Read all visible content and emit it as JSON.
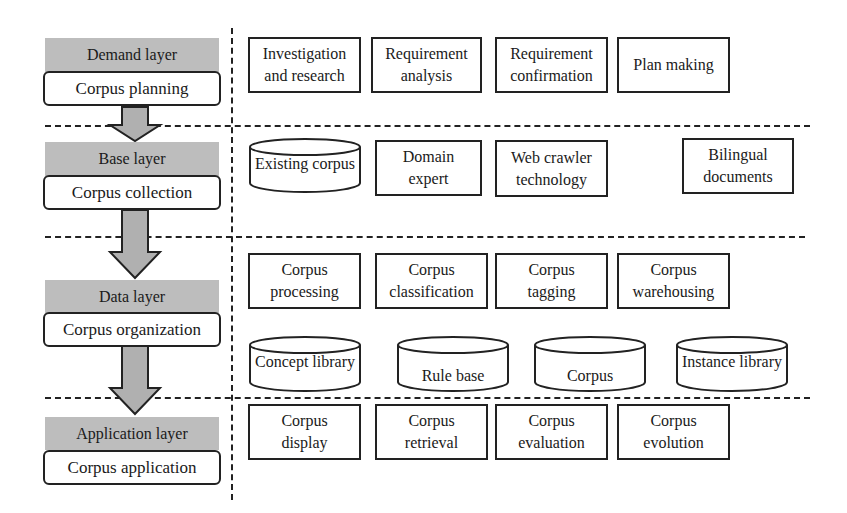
{
  "layers": [
    {
      "name": "Demand layer",
      "stage": "Corpus planning"
    },
    {
      "name": "Base layer",
      "stage": "Corpus collection"
    },
    {
      "name": "Data layer",
      "stage": "Corpus organization"
    },
    {
      "name": "Application layer",
      "stage": "Corpus application"
    }
  ],
  "demand": {
    "items": [
      "Investigation\nand research",
      "Requirement\nanalysis",
      "Requirement\nconfirmation",
      "Plan making"
    ]
  },
  "base": {
    "items": [
      {
        "label": "Existing corpus",
        "shape": "database"
      },
      {
        "label": "Domain\nexpert",
        "shape": "box"
      },
      {
        "label": "Web crawler\ntechnology",
        "shape": "box"
      },
      {
        "label": "Bilingual\ndocuments",
        "shape": "box"
      }
    ]
  },
  "data": {
    "processes": [
      "Corpus\nprocessing",
      "Corpus\nclassification",
      "Corpus\ntagging",
      "Corpus\nwarehousing"
    ],
    "stores": [
      "Concept library",
      "Rule base",
      "Corpus",
      "Instance library"
    ]
  },
  "application": {
    "items": [
      "Corpus\ndisplay",
      "Corpus\nretrieval",
      "Corpus\nevaluation",
      "Corpus\nevolution"
    ]
  },
  "colors": {
    "layer_header": "#bdbdbd",
    "arrow": "#b0b0b0",
    "line": "#222222"
  }
}
